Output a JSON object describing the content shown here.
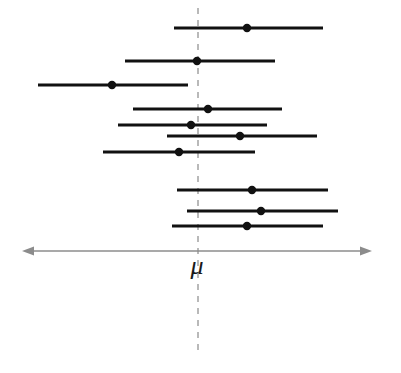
{
  "figure": {
    "width": 401,
    "height": 373,
    "background_color": "#ffffff"
  },
  "axis": {
    "name": "horizontal-number-line",
    "color": "#8c8c8c",
    "y": 251,
    "x_start": 22,
    "x_end": 372,
    "left_arrow": true,
    "right_arrow": true,
    "stroke_width": 1.4
  },
  "reference_line": {
    "label": "μ",
    "label_x": 197,
    "label_y": 274,
    "x": 198,
    "y_top": 8,
    "y_bottom": 356,
    "color": "#a8a8a8",
    "dash": "6,6",
    "stroke_width": 1.6
  },
  "series_style": {
    "interval_color": "#111111",
    "interval_stroke_width": 3.0,
    "point_color": "#111111",
    "point_radius": 4.2
  },
  "chart_data": {
    "type": "errorbar",
    "xlabel": "μ",
    "ylabel": "",
    "grid": false,
    "legend": "none",
    "xlim": [
      22,
      372
    ],
    "reference_value_x": 198,
    "reference_value_label": "μ",
    "point_estimates": [
      247,
      197,
      112,
      208,
      191,
      240,
      179,
      252,
      261,
      247
    ],
    "lower_bounds": [
      174,
      125,
      38,
      133,
      118,
      167,
      103,
      177,
      187,
      172
    ],
    "upper_bounds": [
      323,
      275,
      188,
      282,
      267,
      317,
      255,
      328,
      338,
      323
    ],
    "covers_mu": [
      true,
      true,
      false,
      true,
      true,
      true,
      true,
      true,
      true,
      true
    ],
    "intervals": [
      {
        "id": 1,
        "y": 28,
        "low": 174,
        "point": 247,
        "high": 323,
        "covers_mu": true
      },
      {
        "id": 2,
        "y": 61,
        "low": 125,
        "point": 197,
        "high": 275,
        "covers_mu": true
      },
      {
        "id": 3,
        "y": 85,
        "low": 38,
        "point": 112,
        "high": 188,
        "covers_mu": false
      },
      {
        "id": 4,
        "y": 109,
        "low": 133,
        "point": 208,
        "high": 282,
        "covers_mu": true
      },
      {
        "id": 5,
        "y": 125,
        "low": 118,
        "point": 191,
        "high": 267,
        "covers_mu": true
      },
      {
        "id": 6,
        "y": 136,
        "low": 167,
        "point": 240,
        "high": 317,
        "covers_mu": true
      },
      {
        "id": 7,
        "y": 152,
        "low": 103,
        "point": 179,
        "high": 255,
        "covers_mu": true
      },
      {
        "id": 8,
        "y": 190,
        "low": 177,
        "point": 252,
        "high": 328,
        "covers_mu": true
      },
      {
        "id": 9,
        "y": 211,
        "low": 187,
        "point": 261,
        "high": 338,
        "covers_mu": true
      },
      {
        "id": 10,
        "y": 226,
        "low": 172,
        "point": 247,
        "high": 323,
        "covers_mu": true
      }
    ]
  }
}
